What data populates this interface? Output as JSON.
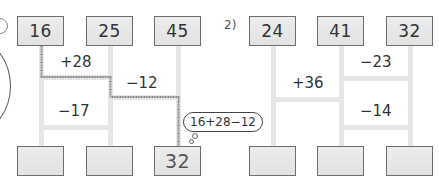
{
  "problem1": {
    "number_label": "",
    "top": [
      "16",
      "25",
      "45"
    ],
    "bottom": [
      "",
      "",
      "32"
    ],
    "rungs": [
      {
        "label": "+28",
        "between": [
          0,
          1
        ]
      },
      {
        "label": "−12",
        "between": [
          1,
          2
        ]
      },
      {
        "label": "−17",
        "between": [
          0,
          1
        ]
      }
    ],
    "hint_bubble": "16+28−12"
  },
  "problem2": {
    "number_label": "2)",
    "top": [
      "24",
      "41",
      "32"
    ],
    "bottom": [
      "",
      "",
      ""
    ],
    "rungs": [
      {
        "label": "−23",
        "between": [
          1,
          2
        ]
      },
      {
        "label": "+36",
        "between": [
          0,
          1
        ]
      },
      {
        "label": "−14",
        "between": [
          1,
          2
        ]
      }
    ]
  },
  "colors": {
    "box_fill": "#e6e6e6",
    "box_border": "#6e6e6e",
    "ladder_line": "#e6e6e6",
    "traced_path": "#7a7a7a"
  }
}
